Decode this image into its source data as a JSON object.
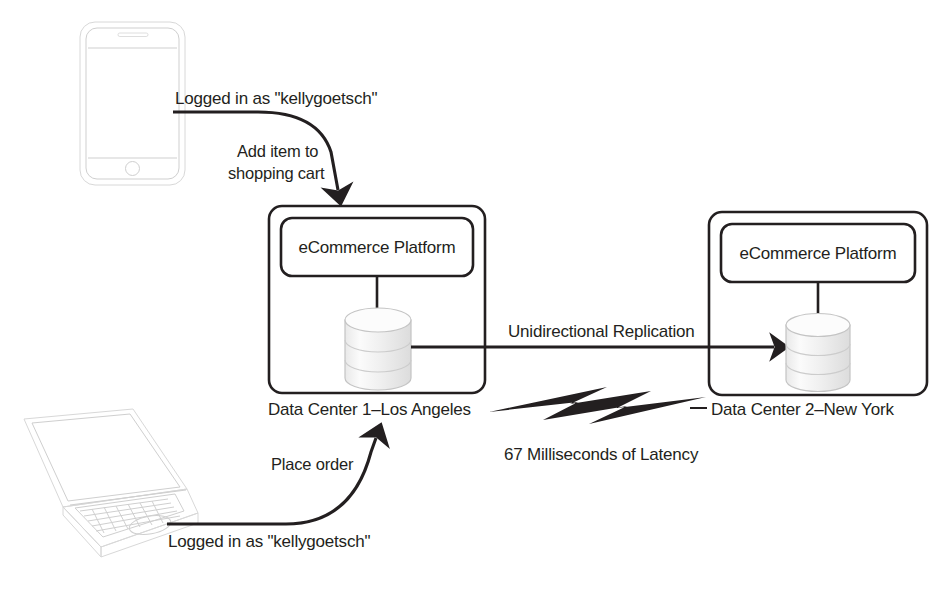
{
  "diagram": {
    "background_color": "#ffffff",
    "line_color": "#231f20",
    "device_outline_color": "#d8d8d8",
    "database_fill_color": "#f2f2f2"
  },
  "devices": {
    "phone": {
      "name": "smartphone",
      "label": ""
    },
    "laptop": {
      "name": "laptop",
      "label": ""
    }
  },
  "flows": {
    "phone_session_label": "Logged in as  \"kellygoetsch\"",
    "phone_action_line1": "Add item to",
    "phone_action_line2": "shopping cart",
    "laptop_session_label": "Logged in as  \"kellygoetsch\"",
    "laptop_action_label": "Place order",
    "replication_label": "Unidirectional Replication",
    "latency_label": "67 Milliseconds of Latency"
  },
  "data_centers": [
    {
      "id": "dc1",
      "caption": "Data Center 1–Los Angeles",
      "platform_label": "eCommerce Platform",
      "database_label": ""
    },
    {
      "id": "dc2",
      "caption": "Data Center 2–New York",
      "platform_label": "eCommerce Platform",
      "database_label": ""
    }
  ]
}
